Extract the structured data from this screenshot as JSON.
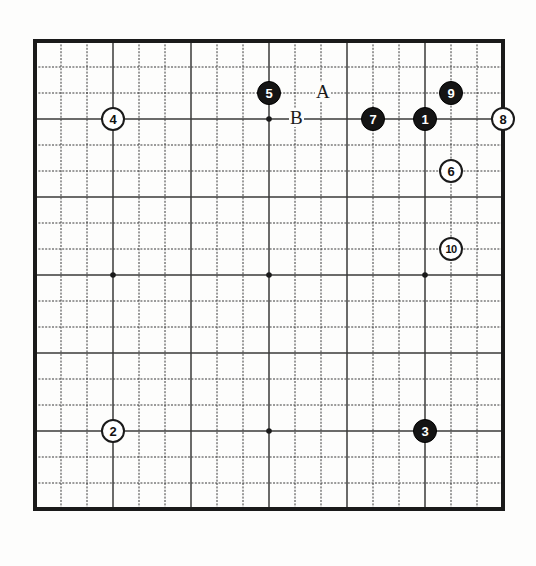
{
  "figure": {
    "kind": "go-board-diagram",
    "board_size": 19,
    "background_color": "#fdfdfc",
    "line_color": "#3a3a3a",
    "border_color": "#1a1a1a",
    "black_color": "#141414",
    "white_color": "#ffffff"
  },
  "board": {
    "star_points": [
      {
        "col": 3,
        "row": 3
      },
      {
        "col": 9,
        "row": 3
      },
      {
        "col": 15,
        "row": 3
      },
      {
        "col": 3,
        "row": 9
      },
      {
        "col": 9,
        "row": 9
      },
      {
        "col": 15,
        "row": 9
      },
      {
        "col": 3,
        "row": 15
      },
      {
        "col": 9,
        "row": 15
      },
      {
        "col": 15,
        "row": 15
      }
    ]
  },
  "stones": [
    {
      "label": "1",
      "color": "black",
      "col": 15,
      "row": 3
    },
    {
      "label": "2",
      "color": "white",
      "col": 3,
      "row": 15
    },
    {
      "label": "3",
      "color": "black",
      "col": 15,
      "row": 15
    },
    {
      "label": "4",
      "color": "white",
      "col": 3,
      "row": 3
    },
    {
      "label": "5",
      "color": "black",
      "col": 9,
      "row": 2
    },
    {
      "label": "6",
      "color": "white",
      "col": 16,
      "row": 5
    },
    {
      "label": "7",
      "color": "black",
      "col": 13,
      "row": 3
    },
    {
      "label": "8",
      "color": "white",
      "col": 18,
      "row": 3
    },
    {
      "label": "9",
      "color": "black",
      "col": 16,
      "row": 2
    },
    {
      "label": "10",
      "color": "white",
      "col": 16,
      "row": 8
    }
  ],
  "markers": [
    {
      "label": "A",
      "col": 11,
      "row": 2
    },
    {
      "label": "B",
      "col": 10,
      "row": 3
    }
  ]
}
